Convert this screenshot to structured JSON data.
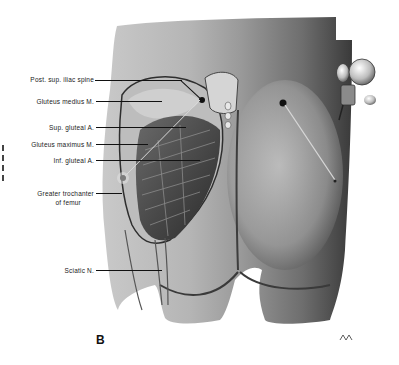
{
  "figure": {
    "panel_letter": "B",
    "labels": [
      {
        "id": "post-sup-iliac-spine",
        "text": "Post. sup. iliac spine"
      },
      {
        "id": "gluteus-medius",
        "text": "Gluteus medius M."
      },
      {
        "id": "sup-gluteal-a",
        "text": "Sup. gluteal A."
      },
      {
        "id": "gluteus-maximus",
        "text": "Gluteus maximus M."
      },
      {
        "id": "inf-gluteal-a",
        "text": "Inf. gluteal A."
      },
      {
        "id": "greater-trochanter-1",
        "text": "Greater trochanter"
      },
      {
        "id": "greater-trochanter-2",
        "text": "of femur"
      },
      {
        "id": "sciatic-n",
        "text": "Sciatic N."
      }
    ],
    "signature": "Artist signature",
    "colors": {
      "ink": "#111111",
      "skin_light": "#d8d8d8",
      "skin_mid": "#a8a8a8",
      "skin_dark": "#4a4a4a",
      "background": "#ffffff"
    }
  }
}
